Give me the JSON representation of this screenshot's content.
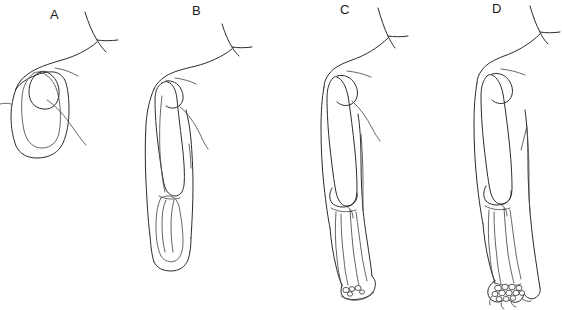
{
  "figure": {
    "background_color": "#ffffff",
    "ink_color": "#2b2b2b",
    "width": 562,
    "height": 310,
    "panel_count": 4
  },
  "panels": [
    {
      "label": "A",
      "label_x": 50,
      "label_y": 20,
      "stage_name": "limb bud paddle",
      "description": "Earliest stage: short limb bud projecting from the body wall with a single undifferentiated cartilage blastema forming a paddle shape; no separate bones are visible.",
      "skeletal_elements": [
        "undifferentiated blastema",
        "early humerus condensation"
      ],
      "digit_rays_visible": 0,
      "carpal_bones_visible": 0,
      "forearm_bones_visible": 0
    },
    {
      "label": "B",
      "label_x": 198,
      "label_y": 16,
      "stage_name": "elongating limb with cartilage models",
      "description": "The limb has elongated; a distinct humerus cartilage model is present and the radius and ulna begin to appear as two parallel elements within the unseparated hand plate.",
      "skeletal_elements": [
        "humerus",
        "radius",
        "ulna",
        "hand plate"
      ],
      "digit_rays_visible": 0,
      "carpal_bones_visible": 0,
      "forearm_bones_visible": 2
    },
    {
      "label": "C",
      "label_x": 344,
      "label_y": 15,
      "stage_name": "separated forearm bones and early digital rays",
      "description": "Humerus, radius and ulna are fully separated with a defined elbow joint; the hand plate shows early carpal condensations and digital ray outlines.",
      "skeletal_elements": [
        "humerus",
        "radius",
        "ulna",
        "early carpals",
        "digital rays"
      ],
      "digit_rays_visible": 3,
      "carpal_bones_visible": 5,
      "forearm_bones_visible": 2
    },
    {
      "label": "D",
      "label_x": 495,
      "label_y": 14,
      "stage_name": "ossified limb with distinct carpals and digits",
      "description": "Mature limb form: ossified humerus with rounded head, distinct radius and ulna articulating at the elbow, a full cluster of carpal bones and separated digit rays forming the hand.",
      "skeletal_elements": [
        "humerus",
        "radius",
        "ulna",
        "carpals",
        "metacarpals",
        "phalanges"
      ],
      "digit_rays_visible": 4,
      "carpal_bones_visible": 12,
      "forearm_bones_visible": 2
    }
  ],
  "legend": {
    "visible": false,
    "entries": []
  }
}
